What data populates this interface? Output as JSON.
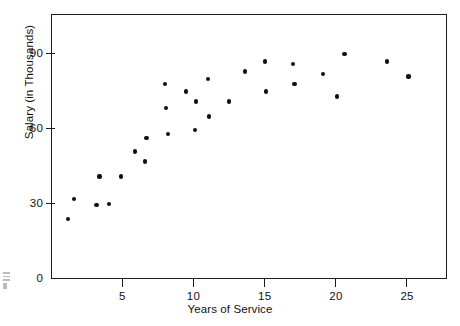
{
  "chart_data": {
    "type": "scatter",
    "title": "",
    "xlabel": "Years of Service",
    "ylabel": "Salary (in Thousands)",
    "xlim": [
      0,
      27.8
    ],
    "ylim": [
      0,
      106
    ],
    "grid": false,
    "legend": null,
    "x_ticks": [
      5,
      10,
      15,
      20,
      25
    ],
    "x_tick_labels": [
      "5",
      "10",
      "15",
      "20",
      "25"
    ],
    "y_ticks": [
      0,
      30,
      60,
      90
    ],
    "y_tick_labels": [
      "0",
      "30",
      "60",
      "90"
    ],
    "marker": "filled-circle",
    "marker_color": "#101010",
    "points": [
      {
        "x": 1.2,
        "y": 24
      },
      {
        "x": 1.6,
        "y": 32
      },
      {
        "x": 3.2,
        "y": 29.5
      },
      {
        "x": 3.4,
        "y": 41
      },
      {
        "x": 4.1,
        "y": 30
      },
      {
        "x": 4.9,
        "y": 41
      },
      {
        "x": 5.9,
        "y": 51
      },
      {
        "x": 6.6,
        "y": 47
      },
      {
        "x": 6.7,
        "y": 56.5
      },
      {
        "x": 8.0,
        "y": 78
      },
      {
        "x": 8.1,
        "y": 68.5
      },
      {
        "x": 8.2,
        "y": 58
      },
      {
        "x": 9.5,
        "y": 75
      },
      {
        "x": 10.1,
        "y": 59.5
      },
      {
        "x": 10.2,
        "y": 71
      },
      {
        "x": 11.0,
        "y": 80
      },
      {
        "x": 11.1,
        "y": 65
      },
      {
        "x": 12.5,
        "y": 71
      },
      {
        "x": 13.6,
        "y": 83
      },
      {
        "x": 15.0,
        "y": 87
      },
      {
        "x": 15.1,
        "y": 75
      },
      {
        "x": 17.0,
        "y": 86
      },
      {
        "x": 17.1,
        "y": 78
      },
      {
        "x": 19.1,
        "y": 82
      },
      {
        "x": 20.1,
        "y": 73
      },
      {
        "x": 20.6,
        "y": 90
      },
      {
        "x": 23.6,
        "y": 87
      },
      {
        "x": 25.1,
        "y": 81
      }
    ]
  },
  "axes": {
    "y_axis_title": "Salary (in Thousands)",
    "x_axis_title": "Years of Service"
  },
  "margin_note": {
    "visible": true,
    "description": "faint page-edge artifact"
  }
}
